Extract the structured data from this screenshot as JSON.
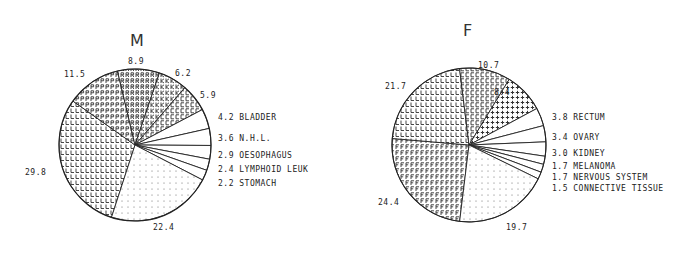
{
  "chart_data": [
    {
      "type": "pie",
      "title": "M",
      "slices": [
        {
          "value": 29.8,
          "label": "",
          "pattern": "L"
        },
        {
          "value": 11.5,
          "label": "",
          "pattern": "P"
        },
        {
          "value": 8.9,
          "label": "",
          "pattern": "R"
        },
        {
          "value": 6.2,
          "label": "",
          "pattern": "K"
        },
        {
          "value": 5.9,
          "label": "",
          "pattern": "C"
        },
        {
          "value": 4.2,
          "label": "BLADDER",
          "pattern": "none"
        },
        {
          "value": 3.6,
          "label": "N.H.L.",
          "pattern": "none"
        },
        {
          "value": 2.9,
          "label": "OESOPHAGUS",
          "pattern": "none"
        },
        {
          "value": 2.4,
          "label": "LYMPHOID LEUK",
          "pattern": "none"
        },
        {
          "value": 2.2,
          "label": "STOMACH",
          "pattern": "none"
        },
        {
          "value": 22.4,
          "label": "",
          "pattern": "dots"
        }
      ],
      "value_labels": [
        "29.8",
        "11.5",
        "8.9",
        "6.2",
        "5.9",
        "22.4"
      ],
      "legend": [
        "4.2 BLADDER",
        "3.6 N.H.L.",
        "2.9 OESOPHAGUS",
        "2.4 LYMPHOID LEUK",
        "2.2 STOMACH"
      ]
    },
    {
      "type": "pie",
      "title": "F",
      "slices": [
        {
          "value": 24.4,
          "label": "",
          "pattern": "F"
        },
        {
          "value": 21.7,
          "label": "",
          "pattern": "L"
        },
        {
          "value": 10.7,
          "label": "",
          "pattern": "C"
        },
        {
          "value": 8.4,
          "label": "",
          "pattern": "plus"
        },
        {
          "value": 3.8,
          "label": "RECTUM",
          "pattern": "none"
        },
        {
          "value": 3.4,
          "label": "OVARY",
          "pattern": "none"
        },
        {
          "value": 3.0,
          "label": "KIDNEY",
          "pattern": "none"
        },
        {
          "value": 1.7,
          "label": "MELANOMA",
          "pattern": "none"
        },
        {
          "value": 1.7,
          "label": "NERVOUS SYSTEM",
          "pattern": "none"
        },
        {
          "value": 1.5,
          "label": "CONNECTIVE TISSUE",
          "pattern": "none"
        },
        {
          "value": 19.7,
          "label": "",
          "pattern": "dots"
        }
      ],
      "value_labels": [
        "24.4",
        "21.7",
        "10.7",
        "8.4",
        "19.7"
      ],
      "legend": [
        "3.8 RECTUM",
        "3.4 OVARY",
        "3.0 KIDNEY",
        "1.7 MELANOMA",
        "1.7 NERVOUS SYSTEM",
        "1.5 CONNECTIVE TISSUE"
      ]
    }
  ],
  "charts": {
    "m": {
      "title": "M",
      "labels": {
        "v298": "29.8",
        "v115": "11.5",
        "v89": "8.9",
        "v62": "6.2",
        "v59": "5.9",
        "v224": "22.4"
      },
      "legend": {
        "l0": "4.2 BLADDER",
        "l1": "3.6 N.H.L.",
        "l2": "2.9 OESOPHAGUS",
        "l3": "2.4 LYMPHOID LEUK",
        "l4": "2.2 STOMACH"
      }
    },
    "f": {
      "title": "F",
      "labels": {
        "v244": "24.4",
        "v217": "21.7",
        "v107": "10.7",
        "v84": "8.4",
        "v197": "19.7"
      },
      "legend": {
        "l0": "3.8 RECTUM",
        "l1": "3.4 OVARY",
        "l2": "3.0 KIDNEY",
        "l3": "1.7 MELANOMA",
        "l4": "1.7 NERVOUS SYSTEM",
        "l5": "1.5 CONNECTIVE TISSUE"
      }
    }
  }
}
